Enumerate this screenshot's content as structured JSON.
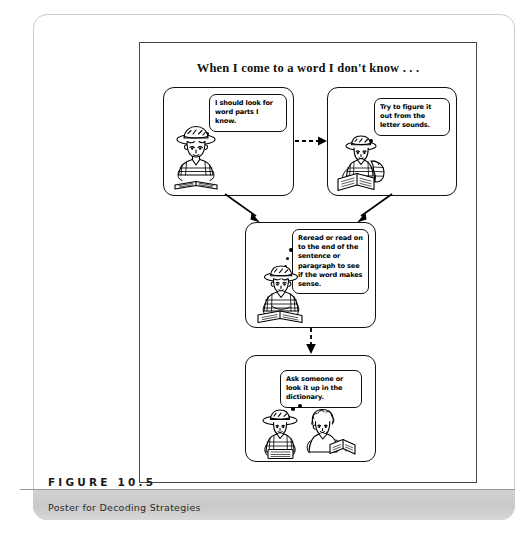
{
  "figure": {
    "number_label": "FIGURE 10.5",
    "caption": "Poster for Decoding Strategies"
  },
  "poster": {
    "title": "When I come to a word I don't know . . .",
    "panels": [
      {
        "id": "panel-1",
        "bubble_text": "I should look for word parts I know.",
        "character": "boy-with-hat-reading-open-book",
        "thought_dots": 3
      },
      {
        "id": "panel-2",
        "bubble_text": "Try to figure it out from the letter sounds.",
        "character": "child-with-hat-and-backpack-reading-book",
        "thought_dots": 3
      },
      {
        "id": "panel-3",
        "bubble_text": "Reread  or read on to the end of the sentence or paragraph to see if the word makes sense.",
        "character": "child-with-hat-seated-reading-book",
        "thought_dots": 3
      },
      {
        "id": "panel-4",
        "bubble_text": "Ask someone or look it up in the dictionary.",
        "character": "two-children-one-with-hat-one-holding-open-book",
        "thought_dots": 3
      }
    ],
    "connectors": [
      {
        "name": "arrow-panel1-to-panel2",
        "style": "dashed",
        "direction": "right"
      },
      {
        "name": "arrow-panel1-to-panel3",
        "style": "solid",
        "direction": "down-right"
      },
      {
        "name": "arrow-panel2-to-panel3",
        "style": "solid",
        "direction": "down-left"
      },
      {
        "name": "arrow-panel3-to-panel4",
        "style": "dashed",
        "direction": "down"
      }
    ]
  },
  "colors": {
    "ink": "#000000",
    "frame": "#4a4a4a",
    "card_border": "#c9c9c9",
    "caption_band": "#cfcfcf",
    "page_background": "#ffffff"
  }
}
